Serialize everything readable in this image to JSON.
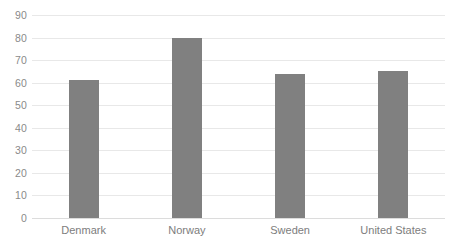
{
  "chart_data": {
    "type": "bar",
    "title": "",
    "subtitle": "",
    "xlabel": "",
    "ylabel": "",
    "categories": [
      "Denmark",
      "Norway",
      "Sweden",
      "United States"
    ],
    "values": [
      61,
      80,
      64,
      65
    ],
    "series": [
      {
        "name": "",
        "values": [
          61,
          80,
          64,
          65
        ]
      }
    ],
    "ylim": [
      0,
      90
    ],
    "ytick_labels": [
      "90",
      "80",
      "70",
      "60",
      "50",
      "40",
      "30",
      "20",
      "10",
      "0"
    ],
    "ytick_values": [
      90,
      80,
      70,
      60,
      50,
      40,
      30,
      20,
      10,
      0
    ],
    "xtick_labels": [
      "Denmark",
      "Norway",
      "Sweden",
      "United States"
    ],
    "grid": true,
    "grid_axis": "y",
    "legend": false,
    "legend_position": "none",
    "annotations": [],
    "data_labels": false,
    "orientation": "vertical",
    "colors": {
      "bar": "#808080",
      "gridline": "#e8e8e8",
      "baseline": "#dcdcdc",
      "tick_text": "#8a8a8a",
      "category_text": "#7d7d7d",
      "background": "#ffffff"
    }
  }
}
